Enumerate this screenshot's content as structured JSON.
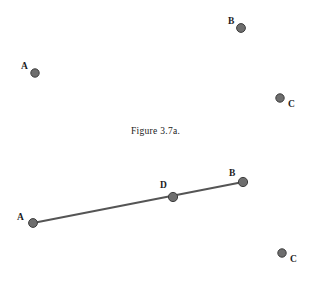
{
  "figure": {
    "caption": "Figure 3.7a.",
    "dot_fill_color": "#6e6e6e",
    "dot_stroke_color": "#3d3d3d",
    "line_color": "#555555",
    "background_color": "#ffffff",
    "label_color": "#1c1c1c"
  },
  "top_panel": {
    "name": "scattered-points-panel",
    "points": [
      {
        "label": "A",
        "x": 35,
        "y": 73,
        "r": 4.2,
        "label_x": 21,
        "label_y": 62
      },
      {
        "label": "B",
        "x": 241,
        "y": 28,
        "r": 4.4,
        "label_x": 228,
        "label_y": 17
      },
      {
        "label": "C",
        "x": 280,
        "y": 98,
        "r": 4.2,
        "label_x": 288,
        "label_y": 100
      }
    ]
  },
  "bottom_panel": {
    "name": "segment-panel",
    "segment": {
      "from": "A",
      "to": "B",
      "x1": 33,
      "y1": 223,
      "x2": 243,
      "y2": 182
    },
    "points": [
      {
        "label": "A",
        "x": 33,
        "y": 223,
        "r": 4.4,
        "label_x": 17,
        "label_y": 213
      },
      {
        "label": "D",
        "x": 173,
        "y": 197,
        "r": 4.6,
        "label_x": 160,
        "label_y": 181
      },
      {
        "label": "B",
        "x": 243,
        "y": 182,
        "r": 4.6,
        "label_x": 229,
        "label_y": 169
      },
      {
        "label": "C",
        "x": 282,
        "y": 253,
        "r": 4.2,
        "label_x": 290,
        "label_y": 255
      }
    ]
  }
}
